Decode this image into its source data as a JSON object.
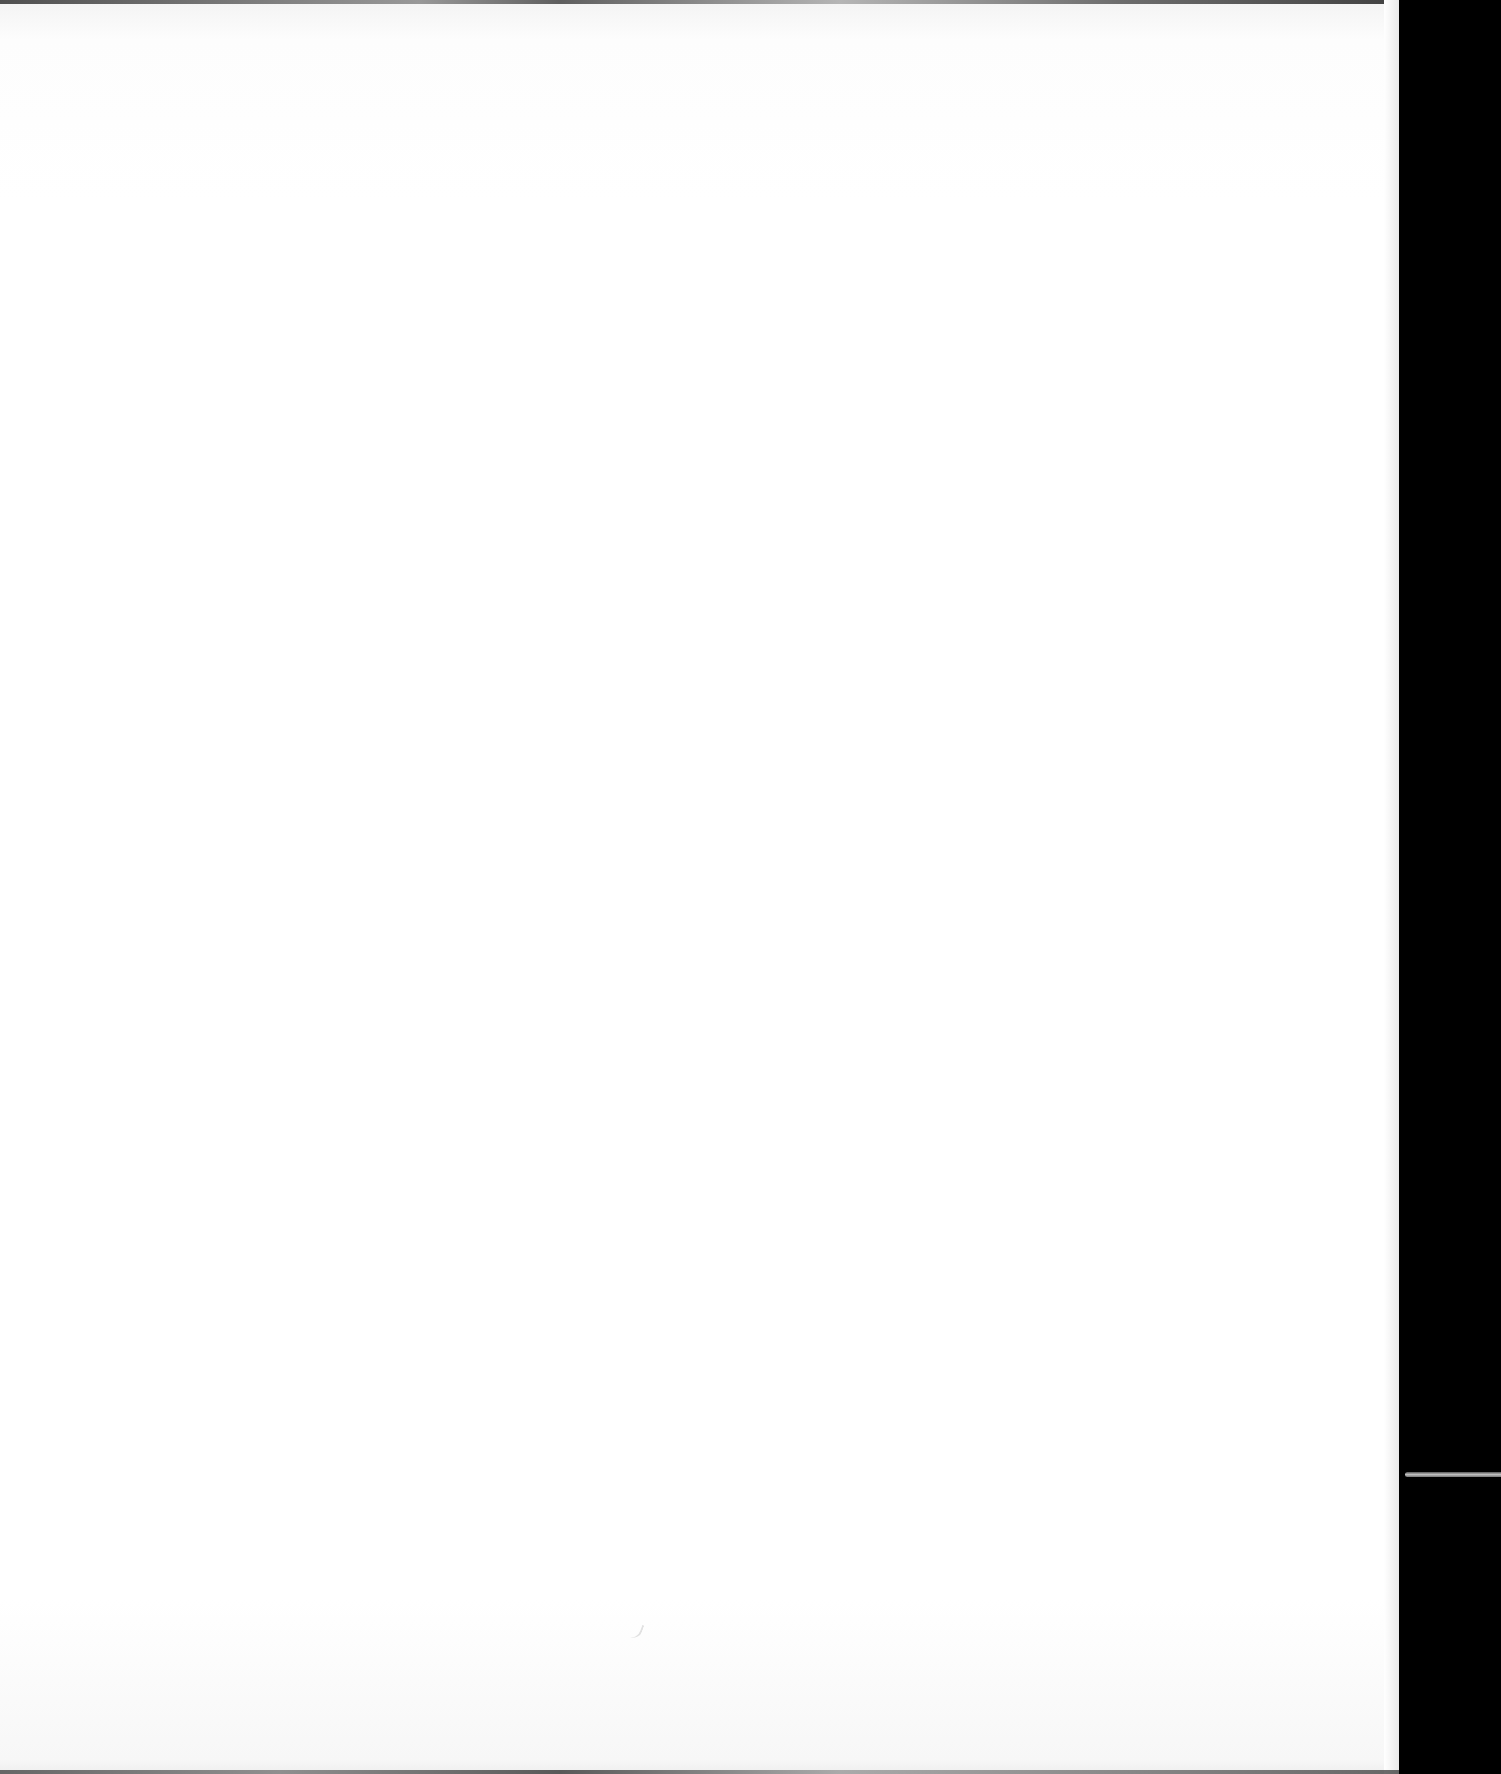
{
  "page": {
    "content": "",
    "background_color": "#ffffff",
    "backdrop_color": "#000000"
  }
}
